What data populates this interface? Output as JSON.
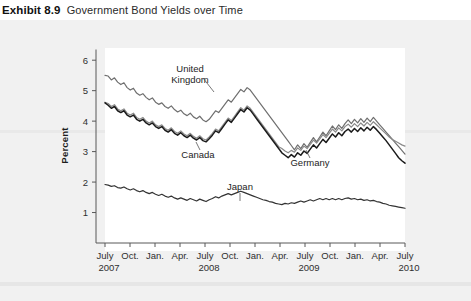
{
  "header": {
    "exhibit_number": "Exhibit 8.9",
    "exhibit_title": "Government Bond Yields over Time"
  },
  "chart_data": {
    "type": "line",
    "title": "Government Bond Yields over Time",
    "xlabel": "",
    "ylabel": "Percent",
    "ylim": [
      0,
      6.4
    ],
    "yticks": [
      1,
      2,
      3,
      4,
      5,
      6
    ],
    "ytick_labels": [
      "1",
      "2",
      "3",
      "4",
      "5",
      "6"
    ],
    "grid": false,
    "legend_position": "inline-annotations",
    "xtick_labels": [
      "July",
      "Oct.",
      "Jan.",
      "Apr.",
      "July",
      "Oct.",
      "Jan.",
      "Apr.",
      "July",
      "Oct.",
      "Jan.",
      "Apr.",
      "July"
    ],
    "year_labels": [
      "2007",
      "2008",
      "2009",
      "2010"
    ],
    "x_start": "2007-07",
    "x_end": "2010-07",
    "annotations": [
      {
        "text": "United Kingdom",
        "series": "United Kingdom"
      },
      {
        "text": "Canada",
        "series": "Canada"
      },
      {
        "text": "Germany",
        "series": "Germany"
      },
      {
        "text": "Japan",
        "series": "Japan"
      }
    ],
    "series": [
      {
        "name": "United Kingdom",
        "color": "#6f6f6f",
        "values": [
          5.5,
          5.48,
          5.35,
          5.42,
          5.28,
          5.2,
          5.26,
          5.1,
          5.02,
          5.08,
          4.92,
          4.85,
          4.9,
          4.78,
          4.7,
          4.76,
          4.62,
          4.55,
          4.6,
          4.48,
          4.42,
          4.5,
          4.38,
          4.3,
          4.36,
          4.24,
          4.18,
          4.26,
          4.14,
          4.08,
          4.16,
          4.04,
          3.98,
          4.06,
          4.2,
          4.34,
          4.28,
          4.42,
          4.56,
          4.7,
          4.62,
          4.76,
          4.9,
          5.04,
          4.96,
          5.1,
          5.02,
          4.88,
          4.74,
          4.6,
          4.46,
          4.32,
          4.18,
          4.04,
          3.9,
          3.76,
          3.62,
          3.48,
          3.34,
          3.2,
          3.06,
          3.22,
          3.1,
          3.26,
          3.14,
          3.3,
          3.46,
          3.32,
          3.48,
          3.64,
          3.52,
          3.68,
          3.84,
          3.72,
          3.88,
          3.76,
          3.92,
          4.04,
          3.92,
          4.06,
          3.94,
          4.08,
          3.96,
          4.1,
          3.98,
          4.12,
          4.0,
          3.88,
          3.76,
          3.64,
          3.52,
          3.4,
          3.28,
          3.16,
          3.04,
          2.92
        ]
      },
      {
        "name": "Germany",
        "color": "#8a8a8a",
        "values": [
          4.62,
          4.58,
          4.48,
          4.54,
          4.4,
          4.34,
          4.4,
          4.26,
          4.2,
          4.26,
          4.12,
          4.06,
          4.12,
          4.0,
          3.94,
          4.0,
          3.88,
          3.82,
          3.88,
          3.76,
          3.7,
          3.78,
          3.66,
          3.6,
          3.68,
          3.58,
          3.52,
          3.6,
          3.5,
          3.44,
          3.52,
          3.42,
          3.38,
          3.48,
          3.6,
          3.74,
          3.68,
          3.82,
          3.96,
          4.1,
          4.02,
          4.16,
          4.3,
          4.44,
          4.36,
          4.5,
          4.42,
          4.28,
          4.14,
          4.0,
          3.86,
          3.72,
          3.58,
          3.44,
          3.3,
          3.16,
          3.1,
          3.02,
          2.96,
          3.04,
          2.98,
          3.12,
          3.04,
          3.18,
          3.1,
          3.24,
          3.38,
          3.28,
          3.42,
          3.56,
          3.46,
          3.6,
          3.74,
          3.64,
          3.78,
          3.68,
          3.82,
          3.9,
          3.8,
          3.92,
          3.82,
          3.94,
          3.84,
          3.96,
          3.86,
          3.98,
          3.88,
          3.78,
          3.68,
          3.58,
          3.48,
          3.4,
          3.34,
          3.28,
          3.22,
          3.18
        ]
      },
      {
        "name": "Canada",
        "color": "#1a1a1a",
        "values": [
          4.6,
          4.52,
          4.42,
          4.48,
          4.34,
          4.28,
          4.34,
          4.2,
          4.14,
          4.2,
          4.06,
          4.0,
          4.06,
          3.94,
          3.88,
          3.94,
          3.82,
          3.76,
          3.82,
          3.7,
          3.64,
          3.72,
          3.6,
          3.54,
          3.62,
          3.52,
          3.46,
          3.54,
          3.44,
          3.38,
          3.46,
          3.36,
          3.32,
          3.42,
          3.54,
          3.68,
          3.62,
          3.76,
          3.9,
          4.04,
          3.96,
          4.1,
          4.24,
          4.38,
          4.3,
          4.44,
          4.36,
          4.22,
          4.08,
          3.94,
          3.8,
          3.66,
          3.52,
          3.38,
          3.24,
          3.1,
          2.96,
          2.88,
          2.8,
          2.9,
          2.82,
          2.96,
          2.88,
          3.02,
          2.94,
          3.08,
          3.22,
          3.12,
          3.26,
          3.4,
          3.3,
          3.44,
          3.58,
          3.48,
          3.62,
          3.52,
          3.66,
          3.74,
          3.64,
          3.76,
          3.66,
          3.78,
          3.68,
          3.8,
          3.7,
          3.82,
          3.72,
          3.6,
          3.48,
          3.36,
          3.22,
          3.08,
          2.94,
          2.8,
          2.7,
          2.62
        ]
      },
      {
        "name": "Japan",
        "color": "#333333",
        "values": [
          1.92,
          1.9,
          1.86,
          1.88,
          1.82,
          1.8,
          1.84,
          1.78,
          1.74,
          1.78,
          1.72,
          1.68,
          1.72,
          1.66,
          1.62,
          1.66,
          1.6,
          1.56,
          1.6,
          1.54,
          1.5,
          1.54,
          1.48,
          1.44,
          1.48,
          1.44,
          1.4,
          1.46,
          1.42,
          1.38,
          1.44,
          1.4,
          1.36,
          1.42,
          1.46,
          1.52,
          1.48,
          1.54,
          1.58,
          1.62,
          1.58,
          1.62,
          1.66,
          1.7,
          1.66,
          1.62,
          1.58,
          1.54,
          1.5,
          1.46,
          1.42,
          1.4,
          1.36,
          1.34,
          1.3,
          1.28,
          1.26,
          1.3,
          1.28,
          1.32,
          1.3,
          1.34,
          1.38,
          1.34,
          1.38,
          1.42,
          1.38,
          1.42,
          1.46,
          1.42,
          1.46,
          1.42,
          1.46,
          1.42,
          1.46,
          1.42,
          1.46,
          1.48,
          1.44,
          1.46,
          1.42,
          1.44,
          1.4,
          1.42,
          1.38,
          1.4,
          1.36,
          1.34,
          1.3,
          1.28,
          1.24,
          1.22,
          1.2,
          1.18,
          1.16,
          1.14
        ]
      }
    ]
  }
}
